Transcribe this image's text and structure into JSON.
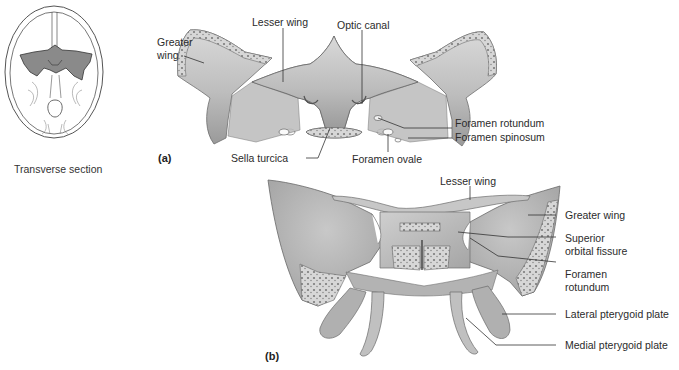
{
  "figure": {
    "colors": {
      "bone_fill": "#b9b9b9",
      "bone_light": "#d6d6d6",
      "bone_dark": "#8f8f8f",
      "cut_surface": "#cfcfcf",
      "skull_highlight": "#8a8a8a",
      "leader_line": "#333333",
      "background": "#ffffff"
    }
  },
  "inset": {
    "caption": "Transverse section",
    "highlight": "sphenoid-region"
  },
  "panel_a": {
    "tag": "(a)",
    "labels": {
      "greater_wing_1": "Greater",
      "greater_wing_2": "wing",
      "lesser_wing": "Lesser wing",
      "optic_canal": "Optic canal",
      "foramen_rotundum": "Foramen rotundum",
      "foramen_spinosum": "Foramen spinosum",
      "foramen_ovale": "Foramen ovale",
      "sella_turcica": "Sella turcica"
    }
  },
  "panel_b": {
    "tag": "(b)",
    "labels": {
      "lesser_wing": "Lesser wing",
      "greater_wing": "Greater wing",
      "superior_orbital_fissure_1": "Superior",
      "superior_orbital_fissure_2": "orbital fissure",
      "foramen_rotundum_1": "Foramen",
      "foramen_rotundum_2": "rotundum",
      "lateral_pterygoid_plate": "Lateral pterygoid plate",
      "medial_pterygoid_plate": "Medial pterygoid plate"
    }
  }
}
